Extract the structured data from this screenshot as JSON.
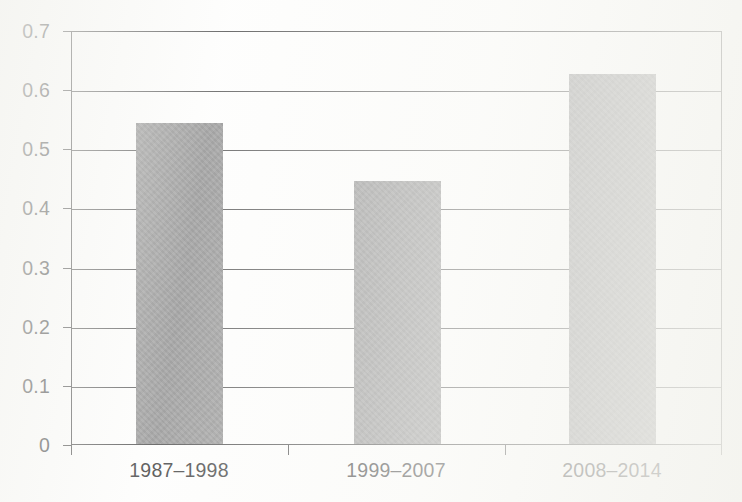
{
  "chart_data": {
    "type": "bar",
    "title": "",
    "subtitle": "",
    "xlabel": "",
    "ylabel": "",
    "categories": [
      "1987–1998",
      "1999–2007",
      "2008–2014"
    ],
    "values": [
      0.545,
      0.447,
      0.628
    ],
    "series": [
      {
        "name": "",
        "values": [
          0.545,
          0.447,
          0.628
        ]
      }
    ],
    "ylim": [
      0,
      0.7
    ],
    "ytick_labels": [
      "0",
      "0.1",
      "0.2",
      "0.3",
      "0.4",
      "0.5",
      "0.6",
      "0.7"
    ],
    "ytick_values": [
      0,
      0.1,
      0.2,
      0.3,
      0.4,
      0.5,
      0.6,
      0.7
    ],
    "grid": true,
    "grid_axis": "y",
    "legend": false,
    "legend_position": "none",
    "annotations": [],
    "bar_color": "#8c8c8c",
    "axis_color": "#3e3e3e",
    "gridline_color": "#4a4a4a",
    "text_color": "#2b2b2b",
    "background_color": "#fdfdfc"
  }
}
